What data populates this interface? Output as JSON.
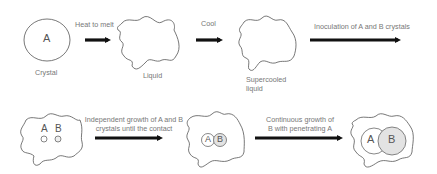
{
  "stages": {
    "crystal": {
      "letter": "A",
      "label": "Crystal"
    },
    "liquid": {
      "label": "Liquid"
    },
    "supercooled": {
      "label_line1": "Supercooled",
      "label_line2": "liquid"
    },
    "nuclei": {
      "a": "A",
      "b": "B"
    },
    "contact": {
      "a": "A",
      "b": "B"
    },
    "penetration": {
      "a": "A",
      "b": "B"
    }
  },
  "arrows": {
    "heat": "Heat to melt",
    "cool": "Cool",
    "inoculation": "Inoculation of A and B crystals",
    "independent_line1": "Independent growth of A and B",
    "independent_line2": "crystals until the contact",
    "continuous_line1": "Continuous growth of",
    "continuous_line2": "B with penetrating A"
  },
  "colors": {
    "stroke": "#555555",
    "arrow": "#111111",
    "b_fill": "#e3e3e3"
  }
}
